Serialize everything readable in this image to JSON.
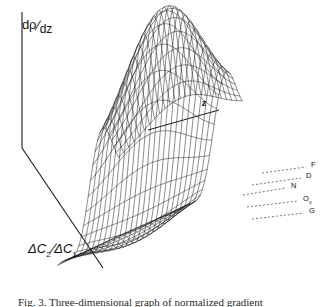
{
  "figure": {
    "kind": "3d-wireframe-surface",
    "background": "#ffffff",
    "ink_color": "#1a1a1a",
    "caption": "Fig. 3.   Three-dimensional graph of normalized gradient"
  },
  "axes": {
    "vertical": {
      "name": "dp-dz",
      "numerator": "dρ",
      "slash": "/",
      "denominator": "dz"
    },
    "depth": {
      "name": "z-axis",
      "label": "z"
    },
    "horizontal": {
      "name": "delta-c-ratio",
      "prefix": "ΔC",
      "sub1": "2",
      "slash": "/",
      "mid": "ΔC",
      "sub2": "1"
    }
  },
  "iso_labels": [
    {
      "id": "F",
      "label": "F",
      "x": 311,
      "y": 165,
      "leader_x1": 262,
      "leader_y1": 173,
      "leader_x2": 306,
      "leader_y2": 167
    },
    {
      "id": "D",
      "label": "D",
      "x": 306,
      "y": 176,
      "leader_x1": 252,
      "leader_y1": 185,
      "leader_x2": 301,
      "leader_y2": 178
    },
    {
      "id": "N",
      "label": "N",
      "x": 291,
      "y": 186,
      "leader_x1": 243,
      "leader_y1": 195,
      "leader_x2": 286,
      "leader_y2": 188
    },
    {
      "id": "Ov",
      "label": "Ov",
      "x": 303,
      "y": 199,
      "leader_x1": 247,
      "leader_y1": 207,
      "leader_x2": 298,
      "leader_y2": 201
    },
    {
      "id": "G",
      "label": "G",
      "x": 309,
      "y": 211,
      "leader_x1": 252,
      "leader_y1": 219,
      "leader_x2": 304,
      "leader_y2": 213
    }
  ],
  "frame": {
    "v_axis": {
      "x1": 22,
      "y1": 12,
      "x2": 22,
      "y2": 148
    },
    "x_axis": {
      "x1": 22,
      "y1": 148,
      "x2": 103,
      "y2": 268
    },
    "z_axis": {
      "x1": 148,
      "y1": 130,
      "x2": 219,
      "y2": 110
    }
  },
  "chart_data": {
    "type": "surface",
    "title": "",
    "xlabel": "ΔC₂/ΔC₁",
    "ylabel": "dρ/dz",
    "zlabel": "z",
    "grid_u": 26,
    "grid_v": 24,
    "projection": {
      "origin_x": 150,
      "origin_y": 196,
      "u_dx": 5.55,
      "u_dy": 3.25,
      "v_dx": 5.15,
      "v_dy": -2.35,
      "height_scale": 178
    },
    "surface_model": {
      "description": "Asymmetric dispersive ridge: tall positive crest at small z falling to a negative trough, modulated along the concentration-ratio axis.",
      "peak_height": 1.0,
      "trough_depth": -0.34,
      "peak_u": 0.3,
      "trough_u": 0.62,
      "ridge_sharpness": 13.0,
      "trough_sharpness": 17.0,
      "v_decay": 1.55
    },
    "iso_lines": [
      "F",
      "D",
      "N",
      "Ov",
      "G"
    ],
    "legend_position": "right-edge-leader-lines",
    "grid": true,
    "axis_ranges": {
      "x": [
        0,
        1
      ],
      "z": [
        0,
        1
      ],
      "y": [
        -0.4,
        1.05
      ]
    }
  }
}
